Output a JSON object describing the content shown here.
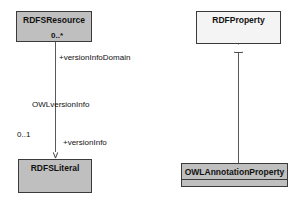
{
  "diagram": {
    "type": "uml-class-diagram",
    "title": "",
    "background_color": "#ffffff",
    "filled_class_color": "#bfbfbf",
    "hollow_class_color": "#f4f4f4",
    "border_color": "#3a3a3a",
    "line_color": "#5a5a5a"
  },
  "classes": [
    {
      "id": "rdfs-resource",
      "name": "RDFSResource",
      "fill": "filled",
      "multiplicity_in_box": "0..*"
    },
    {
      "id": "rdfs-literal",
      "name": "RDFSLiteral",
      "fill": "filled",
      "multiplicity_in_box": ""
    },
    {
      "id": "rdf-property",
      "name": "RDFProperty",
      "fill": "hollow",
      "multiplicity_in_box": ""
    },
    {
      "id": "owl-annotation-property",
      "name": "OWLAnnotationProperty",
      "fill": "filled",
      "multiplicity_in_box": ""
    }
  ],
  "associations": [
    {
      "id": "version-info",
      "from": "rdfs-resource",
      "to": "rdfs-literal",
      "name": "OWLversionInfo",
      "source_role": "+versionInfoDomain",
      "source_multiplicity": "0..*",
      "target_role": "+versionInfo",
      "target_multiplicity": "0..1",
      "arrow": "open"
    }
  ],
  "generalizations": [
    {
      "id": "annotation-is-property",
      "subclass": "owl-annotation-property",
      "superclass": "rdf-property",
      "arrow": "hollow-triangle"
    }
  ],
  "labels": {
    "version_info_domain": "+versionInfoDomain",
    "owl_version_info": "OWLversionInfo",
    "version_info": "+versionInfo",
    "mult_zero_star": "0..*",
    "mult_zero_one": "0..1"
  }
}
